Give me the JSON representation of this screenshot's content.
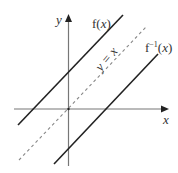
{
  "diagram": {
    "axes": {
      "x_label": "x",
      "y_label": "y",
      "color": "#777777"
    },
    "curves": [
      {
        "id": "f",
        "label_main": "f(",
        "label_var": "x",
        "label_close": ")",
        "style": "solid",
        "color": "#222222"
      },
      {
        "id": "identity",
        "label": "y = x",
        "style": "dashed",
        "color": "#888888"
      },
      {
        "id": "f_inverse",
        "label_main": "f",
        "label_sup": "−1",
        "label_open": "(",
        "label_var": "x",
        "label_close": ")",
        "style": "solid",
        "color": "#222222"
      }
    ]
  }
}
